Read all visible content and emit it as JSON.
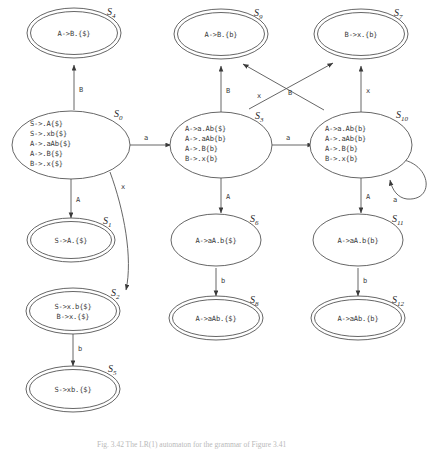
{
  "figure": {
    "caption": "Fig. 3.42 The LR(1) automaton for the grammar of Figure 3.41"
  },
  "states": {
    "S4": {
      "label": "S",
      "sub": "4",
      "accepting": true,
      "items": [
        "A->B.{$}"
      ]
    },
    "S9": {
      "label": "S",
      "sub": "9",
      "accepting": true,
      "items": [
        "A->B.{b}"
      ]
    },
    "S7": {
      "label": "S",
      "sub": "7",
      "accepting": true,
      "items": [
        "B->x.{b}"
      ]
    },
    "S0": {
      "label": "S",
      "sub": "0",
      "accepting": false,
      "items": [
        "S->.A{$}",
        "S->.xb{$}",
        "A->.aAb{$}",
        "A->.B{$}",
        "B->.x{$}"
      ]
    },
    "S3": {
      "label": "S",
      "sub": "3",
      "accepting": false,
      "items": [
        "A->a.Ab{$}",
        "A->.aAb{b}",
        "A->.B{b}",
        "B->.x{b}"
      ]
    },
    "S10": {
      "label": "S",
      "sub": "10",
      "accepting": false,
      "items": [
        "A->a.Ab{b}",
        "A->.aAb{b}",
        "A->.B{b}",
        "B->.x{b}"
      ]
    },
    "S1": {
      "label": "S",
      "sub": "1",
      "accepting": true,
      "items": [
        "S->A.{$}"
      ]
    },
    "S6": {
      "label": "S",
      "sub": "6",
      "accepting": false,
      "items": [
        "A->aA.b{$}"
      ]
    },
    "S11": {
      "label": "S",
      "sub": "11",
      "accepting": false,
      "items": [
        "A->aA.b{b}"
      ]
    },
    "S2": {
      "label": "S",
      "sub": "2",
      "accepting": true,
      "items": [
        "S->x.b{$}",
        "B->x.{$}"
      ]
    },
    "S8": {
      "label": "S",
      "sub": "8",
      "accepting": true,
      "items": [
        "A->aAb.{$}"
      ]
    },
    "S12": {
      "label": "S",
      "sub": "12",
      "accepting": true,
      "items": [
        "A->aAb.{b}"
      ]
    },
    "S5": {
      "label": "S",
      "sub": "5",
      "accepting": true,
      "items": [
        "S->xb.{$}"
      ]
    }
  },
  "transitions": [
    {
      "from": "S0",
      "to": "S4",
      "symbol": "B"
    },
    {
      "from": "S0",
      "to": "S1",
      "symbol": "A"
    },
    {
      "from": "S0",
      "to": "S2",
      "symbol": "x"
    },
    {
      "from": "S0",
      "to": "S3",
      "symbol": "a"
    },
    {
      "from": "S3",
      "to": "S9",
      "symbol": "B"
    },
    {
      "from": "S3",
      "to": "S7",
      "symbol": "x"
    },
    {
      "from": "S3",
      "to": "S6",
      "symbol": "A"
    },
    {
      "from": "S3",
      "to": "S10",
      "symbol": "a"
    },
    {
      "from": "S10",
      "to": "S9",
      "symbol": "B"
    },
    {
      "from": "S10",
      "to": "S7",
      "symbol": "x"
    },
    {
      "from": "S10",
      "to": "S11",
      "symbol": "A"
    },
    {
      "from": "S10",
      "to": "S10",
      "symbol": "a"
    },
    {
      "from": "S2",
      "to": "S5",
      "symbol": "b"
    },
    {
      "from": "S6",
      "to": "S8",
      "symbol": "b"
    },
    {
      "from": "S11",
      "to": "S12",
      "symbol": "b"
    }
  ],
  "colors": {
    "stroke": "#555555",
    "text": "#3a3a3a",
    "background": "#ffffff",
    "caption": "#b9b9b9"
  }
}
